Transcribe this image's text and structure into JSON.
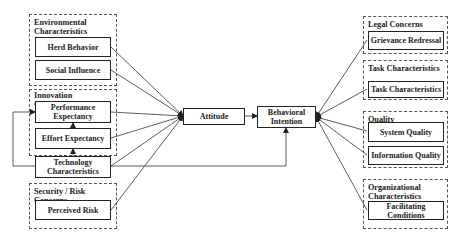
{
  "diagram": {
    "type": "research-model",
    "left_groups": [
      {
        "id": "env",
        "label": "Environmental Characteristics",
        "constructs": [
          "Herd Behavior",
          "Social Influence"
        ]
      },
      {
        "id": "innov",
        "label": "Innovation Characteristics",
        "constructs": [
          "Performance Expectancy",
          "Effort Expectancy",
          "Technology Characteristics"
        ]
      },
      {
        "id": "sec",
        "label": "Security / Risk Concerns",
        "constructs": [
          "Perceived Risk"
        ]
      }
    ],
    "center": {
      "attitude": "Attitude",
      "intention": "Behavioral Intention"
    },
    "right_groups": [
      {
        "id": "legal",
        "label": "Legal Concerns",
        "constructs": [
          "Grievance Redressal"
        ]
      },
      {
        "id": "task",
        "label": "Task Characteristics",
        "constructs": [
          "Task Characteristics"
        ]
      },
      {
        "id": "quality",
        "label": "Quality Characteristics",
        "constructs": [
          "System Quality",
          "Information Quality"
        ]
      },
      {
        "id": "org",
        "label": "Organizational Characteristics",
        "constructs": [
          "Facilitating Conditions"
        ]
      }
    ],
    "edges": [
      [
        "Herd Behavior",
        "Attitude"
      ],
      [
        "Social Influence",
        "Attitude"
      ],
      [
        "Performance Expectancy",
        "Attitude"
      ],
      [
        "Effort Expectancy",
        "Attitude"
      ],
      [
        "Technology Characteristics",
        "Attitude"
      ],
      [
        "Perceived Risk",
        "Attitude"
      ],
      [
        "Effort Expectancy",
        "Performance Expectancy"
      ],
      [
        "Technology Characteristics",
        "Effort Expectancy"
      ],
      [
        "Technology Characteristics",
        "Performance Expectancy"
      ],
      [
        "Technology Characteristics",
        "Behavioral Intention"
      ],
      [
        "Attitude",
        "Behavioral Intention"
      ],
      [
        "Grievance Redressal",
        "Behavioral Intention"
      ],
      [
        "Task Characteristics",
        "Behavioral Intention"
      ],
      [
        "System Quality",
        "Behavioral Intention"
      ],
      [
        "Information Quality",
        "Behavioral Intention"
      ],
      [
        "Facilitating Conditions",
        "Behavioral Intention"
      ]
    ]
  },
  "labels": {
    "env_group": "Environmental Characteristics",
    "herd": "Herd Behavior",
    "social": "Social Influence",
    "innov_group": "Innovation Characteristics",
    "perf": "Performance Expectancy",
    "effort": "Effort Expectancy",
    "tech": "Technology Characteristics",
    "sec_group": "Security / Risk Concerns",
    "risk": "Perceived Risk",
    "attitude": "Attitude",
    "intention": "Behavioral Intention",
    "legal_group": "Legal Concerns",
    "grievance": "Grievance Redressal",
    "task_group": "Task Characteristics",
    "task": "Task Characteristics",
    "quality_group": "Quality Characteristics",
    "system": "System Quality",
    "info": "Information Quality",
    "org_group": "Organizational Characteristics",
    "facil": "Facilitating Conditions"
  },
  "colors": {
    "line": "#333333",
    "box_border": "#222222",
    "group_border": "#555555"
  }
}
